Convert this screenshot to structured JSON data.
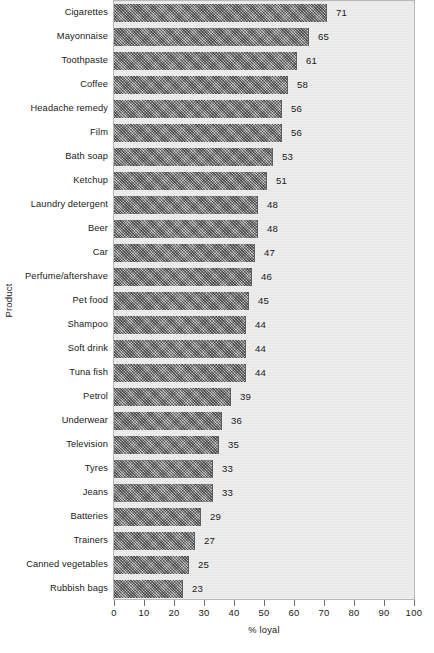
{
  "chart_data": {
    "type": "bar",
    "orientation": "horizontal",
    "title": "",
    "xlabel": "% loyal",
    "ylabel": "Product",
    "xlim": [
      0,
      100
    ],
    "xticks": [
      0,
      10,
      20,
      30,
      40,
      50,
      60,
      70,
      80,
      90,
      100
    ],
    "grid": false,
    "legend": null,
    "bar_color": "#8a8a8a",
    "plot_background": "#ebebeb",
    "categories": [
      "Cigarettes",
      "Mayonnaise",
      "Toothpaste",
      "Coffee",
      "Headache remedy",
      "Film",
      "Bath soap",
      "Ketchup",
      "Laundry detergent",
      "Beer",
      "Car",
      "Perfume/aftershave",
      "Pet food",
      "Shampoo",
      "Soft drink",
      "Tuna fish",
      "Petrol",
      "Underwear",
      "Television",
      "Tyres",
      "Jeans",
      "Batteries",
      "Trainers",
      "Canned vegetables",
      "Rubbish bags"
    ],
    "values": [
      71,
      65,
      61,
      58,
      56,
      56,
      53,
      51,
      48,
      48,
      47,
      46,
      45,
      44,
      44,
      44,
      39,
      36,
      35,
      33,
      33,
      29,
      27,
      25,
      23
    ],
    "value_labels": [
      "71",
      "65",
      "61",
      "58",
      "56",
      "56",
      "53",
      "51",
      "48",
      "48",
      "47",
      "46",
      "45",
      "44",
      "44",
      "44",
      "39",
      "36",
      "35",
      "33",
      "33",
      "29",
      "27",
      "25",
      "23"
    ],
    "xtick_labels": [
      "0",
      "10",
      "20",
      "30",
      "40",
      "50",
      "60",
      "70",
      "80",
      "90",
      "100"
    ]
  }
}
